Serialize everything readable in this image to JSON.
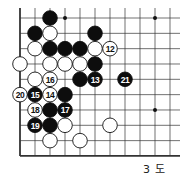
{
  "diagram": {
    "caption": "3 도",
    "board": {
      "visible_columns": 11,
      "visible_rows": 10,
      "origin_x": 20,
      "origin_y": 18,
      "spacing_x": 15,
      "spacing_y": 15.33,
      "edges": {
        "left": true,
        "bottom": true,
        "top": false,
        "right": false
      },
      "line_color": "#333333",
      "star_points": [
        {
          "col": 3,
          "row": 0
        },
        {
          "col": 9,
          "row": 0
        },
        {
          "col": 9,
          "row": 6
        },
        {
          "col": 3,
          "row": 6
        }
      ]
    },
    "stones": [
      {
        "color": "black",
        "col": 2,
        "row": 0,
        "label": ""
      },
      {
        "color": "black",
        "col": 1,
        "row": 1,
        "label": ""
      },
      {
        "color": "white",
        "col": 2,
        "row": 1,
        "label": ""
      },
      {
        "color": "black",
        "col": 5,
        "row": 1,
        "label": ""
      },
      {
        "color": "white",
        "col": 1,
        "row": 2,
        "label": ""
      },
      {
        "color": "black",
        "col": 2,
        "row": 2,
        "label": ""
      },
      {
        "color": "black",
        "col": 3,
        "row": 2,
        "label": ""
      },
      {
        "color": "black",
        "col": 4,
        "row": 2,
        "label": ""
      },
      {
        "color": "white",
        "col": 5,
        "row": 2,
        "label": ""
      },
      {
        "color": "white",
        "col": 6,
        "row": 2,
        "label": "12"
      },
      {
        "color": "white",
        "col": 0,
        "row": 3,
        "label": ""
      },
      {
        "color": "white",
        "col": 2,
        "row": 3,
        "label": ""
      },
      {
        "color": "white",
        "col": 3,
        "row": 3,
        "label": ""
      },
      {
        "color": "white",
        "col": 4,
        "row": 3,
        "label": ""
      },
      {
        "color": "black",
        "col": 5,
        "row": 3,
        "label": ""
      },
      {
        "color": "white",
        "col": 1,
        "row": 4,
        "label": ""
      },
      {
        "color": "white",
        "col": 2,
        "row": 4,
        "label": "16"
      },
      {
        "color": "black",
        "col": 4,
        "row": 4,
        "label": ""
      },
      {
        "color": "black",
        "col": 5,
        "row": 4,
        "label": "13"
      },
      {
        "color": "black",
        "col": 7,
        "row": 4,
        "label": "21"
      },
      {
        "color": "white",
        "col": 0,
        "row": 5,
        "label": "20"
      },
      {
        "color": "black",
        "col": 1,
        "row": 5,
        "label": "15"
      },
      {
        "color": "white",
        "col": 2,
        "row": 5,
        "label": "14"
      },
      {
        "color": "black",
        "col": 3,
        "row": 5,
        "label": ""
      },
      {
        "color": "white",
        "col": 1,
        "row": 6,
        "label": "18"
      },
      {
        "color": "black",
        "col": 2,
        "row": 6,
        "label": ""
      },
      {
        "color": "black",
        "col": 3,
        "row": 6,
        "label": "17"
      },
      {
        "color": "black",
        "col": 1,
        "row": 7,
        "label": "19"
      },
      {
        "color": "black",
        "col": 2,
        "row": 7,
        "label": ""
      },
      {
        "color": "white",
        "col": 3,
        "row": 7,
        "label": ""
      },
      {
        "color": "white",
        "col": 6,
        "row": 7,
        "label": ""
      },
      {
        "color": "white",
        "col": 2,
        "row": 8,
        "label": ""
      },
      {
        "color": "white",
        "col": 4,
        "row": 8,
        "label": ""
      }
    ]
  }
}
